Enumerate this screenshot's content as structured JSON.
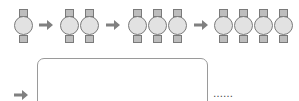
{
  "diagram": {
    "colors": {
      "circle_fill": "#e2e2e2",
      "square_fill": "#bdbdbd",
      "outline": "#7a7a7a",
      "arrow": "#808080",
      "box_border": "#9a9a9a"
    },
    "groups": [
      {
        "units": 1
      },
      {
        "units": 2
      },
      {
        "units": 3
      },
      {
        "units": 4
      }
    ],
    "continuation": {
      "box": "empty",
      "ellipsis": "……"
    }
  }
}
